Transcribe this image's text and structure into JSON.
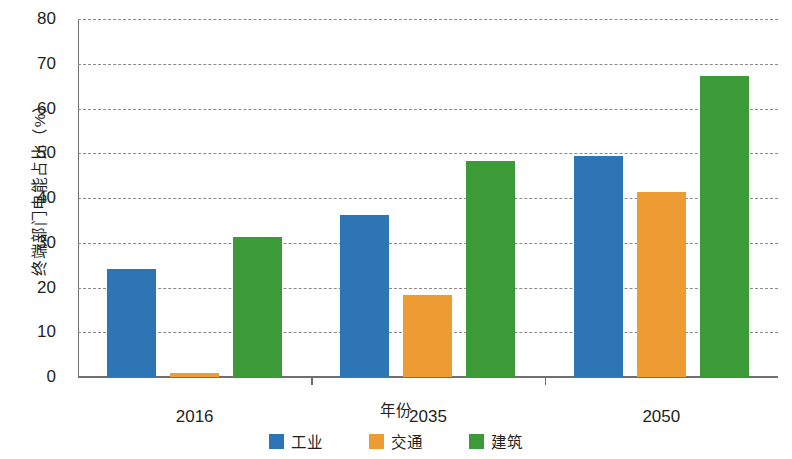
{
  "chart_data": {
    "type": "bar",
    "title": "",
    "xlabel": "年份",
    "ylabel": "终端部门电能占比（%）",
    "categories": [
      "2016",
      "2035",
      "2050"
    ],
    "series": [
      {
        "name": "工业",
        "color": "#2e75b6",
        "values": [
          24.2,
          36.2,
          49.4
        ]
      },
      {
        "name": "交通",
        "color": "#ed9b33",
        "values": [
          1.0,
          18.3,
          41.3
        ]
      },
      {
        "name": "建筑",
        "color": "#3c9a38",
        "values": [
          31.3,
          48.3,
          67.2
        ]
      }
    ],
    "ylim": [
      0,
      80
    ],
    "ytick_labels": [
      "0",
      "10",
      "20",
      "30",
      "40",
      "50",
      "60",
      "70",
      "80"
    ],
    "ytick_values": [
      0,
      10,
      20,
      30,
      40,
      50,
      60,
      70,
      80
    ],
    "grid": true,
    "grid_style": "dashed",
    "legend_position": "bottom"
  }
}
